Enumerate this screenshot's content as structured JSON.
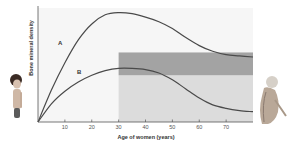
{
  "chart_data": {
    "type": "line",
    "title": "",
    "xlabel": "Age of women (years)",
    "ylabel": "Bone mineral density",
    "xlim": [
      0,
      80
    ],
    "ylim": [
      0,
      100
    ],
    "x_ticks": [
      10,
      20,
      30,
      40,
      50,
      60,
      70
    ],
    "y_ticks": [],
    "grid": false,
    "legend": "inline labels",
    "series": [
      {
        "name": "A",
        "x": [
          0,
          5,
          10,
          15,
          20,
          25,
          30,
          35,
          40,
          45,
          50,
          55,
          60,
          65,
          70,
          75,
          80
        ],
        "values": [
          0,
          28,
          52,
          72,
          86,
          94,
          96,
          95,
          92,
          88,
          82,
          74,
          67,
          62,
          59,
          58,
          57
        ]
      },
      {
        "name": "B",
        "x": [
          0,
          5,
          10,
          15,
          20,
          25,
          30,
          35,
          40,
          45,
          50,
          55,
          60,
          65,
          70,
          75,
          80
        ],
        "values": [
          0,
          16,
          27,
          35,
          41,
          45,
          47,
          47,
          46,
          43,
          37,
          29,
          21,
          15,
          12,
          10,
          9
        ]
      }
    ],
    "annotations": [
      {
        "type": "band",
        "label": "",
        "x_range": [
          30,
          80
        ],
        "y_range": [
          41,
          61
        ],
        "color": "#a3a3a3"
      },
      {
        "type": "band",
        "label": "",
        "x_range": [
          30,
          80
        ],
        "y_range": [
          0,
          41
        ],
        "color": "#dcdcdc"
      },
      {
        "type": "image",
        "label": "young-woman-figure",
        "position": "left"
      },
      {
        "type": "image",
        "label": "elderly-woman-figure",
        "position": "right"
      }
    ]
  },
  "labels": {
    "xlabel": "Age of women (years)",
    "ylabel": "Bone mineral density",
    "curve_a": "A",
    "curve_b": "B",
    "ticks": [
      "10",
      "20",
      "30",
      "40",
      "50",
      "60",
      "70"
    ]
  },
  "colors": {
    "curve": "#4a4a4a",
    "band_dark": "#a3a3a3",
    "band_light": "#dcdcdc",
    "plot_bg": "#f4f4f4",
    "axis": "#555555"
  }
}
